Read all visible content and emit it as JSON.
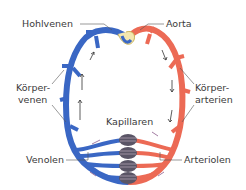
{
  "diagram": {
    "labels": {
      "hohlvenen": "Hohlvenen",
      "aorta": "Aorta",
      "koerpervenen_1": "Körper-",
      "koerpervenen_2": "venen",
      "koerperarterien_1": "Körper-",
      "koerperarterien_2": "arterien",
      "kapillaren": "Kapillaren",
      "venolen": "Venolen",
      "arteriolen": "Arteriolen"
    },
    "colors": {
      "vein": "#3a67c4",
      "vein_dark": "#2a4f9e",
      "artery": "#ec6a55",
      "artery_dark": "#c9483a",
      "capillary": "#5a5566",
      "leader_line": "#555555",
      "arrow": "#333333",
      "arrow_purple": "#8a5a8a"
    }
  }
}
